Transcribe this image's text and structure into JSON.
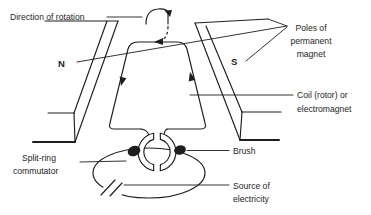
{
  "figure": {
    "type": "labeled-physics-diagram",
    "labels": {
      "direction_of_rotation": "Direction of rotation",
      "pole_n": "N",
      "pole_s": "S",
      "poles_line1": "Poles of",
      "poles_line2": "permanent",
      "poles_line3": "magnet",
      "coil_line1": "Coil (rotor) or",
      "coil_line2": "electromagnet",
      "brush": "Brush",
      "splitring_line1": "Split-ring",
      "splitring_line2": "commutator",
      "source_line1": "Source of",
      "source_line2": "electricity"
    },
    "colors": {
      "line": "#1e1e1e",
      "background": "#ffffff",
      "brush_fill": "#111111"
    }
  }
}
